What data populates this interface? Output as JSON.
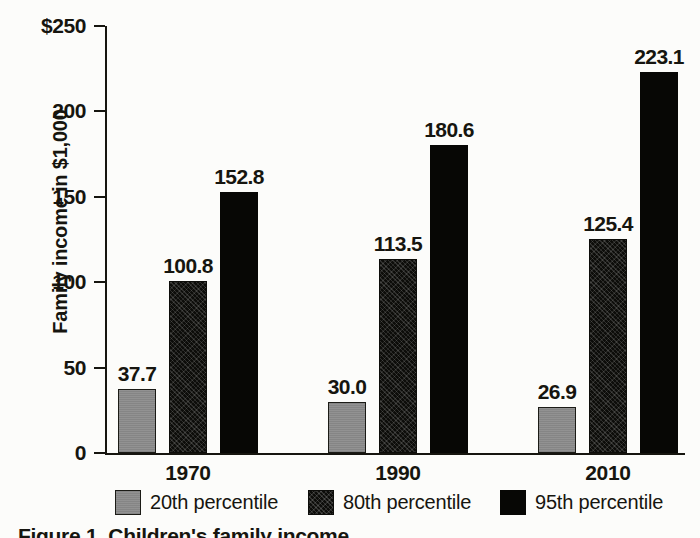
{
  "chart_data": {
    "type": "bar",
    "title": "",
    "xlabel": "",
    "ylabel": "Family income in $1,000",
    "categories": [
      "1970",
      "1990",
      "2010"
    ],
    "series": [
      {
        "name": "20th percentile",
        "values": [
          37.7,
          30.0,
          26.9
        ],
        "color": "#8c8c8c"
      },
      {
        "name": "80th percentile",
        "values": [
          100.8,
          113.5,
          125.4
        ],
        "color": "#0d0d0a"
      },
      {
        "name": "95th percentile",
        "values": [
          152.8,
          180.6,
          223.1
        ],
        "color": "#070705"
      }
    ],
    "value_labels": [
      [
        "37.7",
        "100.8",
        "152.8"
      ],
      [
        "30.0",
        "113.5",
        "180.6"
      ],
      [
        "26.9",
        "125.4",
        "223.1"
      ]
    ],
    "ylim": [
      0,
      250
    ],
    "ytick_values": [
      0,
      50,
      100,
      150,
      200,
      250
    ],
    "ytick_labels": [
      "0",
      "50",
      "100",
      "150",
      "200",
      "$250"
    ],
    "grid": false,
    "legend_position": "bottom"
  },
  "axis": {
    "y_title": "Family income in $1,000",
    "ticks": [
      {
        "label": "$250",
        "value": 250
      },
      {
        "label": "200",
        "value": 200
      },
      {
        "label": "150",
        "value": 150
      },
      {
        "label": "100",
        "value": 100
      },
      {
        "label": "50",
        "value": 50
      },
      {
        "label": "0",
        "value": 0
      }
    ]
  },
  "groups": [
    {
      "year": "1970",
      "bars": [
        {
          "series": "20th percentile",
          "label": "37.7",
          "value": 37.7
        },
        {
          "series": "80th percentile",
          "label": "100.8",
          "value": 100.8
        },
        {
          "series": "95th percentile",
          "label": "152.8",
          "value": 152.8
        }
      ]
    },
    {
      "year": "1990",
      "bars": [
        {
          "series": "20th percentile",
          "label": "30.0",
          "value": 30.0
        },
        {
          "series": "80th percentile",
          "label": "113.5",
          "value": 113.5
        },
        {
          "series": "95th percentile",
          "label": "180.6",
          "value": 180.6
        }
      ]
    },
    {
      "year": "2010",
      "bars": [
        {
          "series": "20th percentile",
          "label": "26.9",
          "value": 26.9
        },
        {
          "series": "80th percentile",
          "label": "125.4",
          "value": 125.4
        },
        {
          "series": "95th percentile",
          "label": "223.1",
          "value": 223.1
        }
      ]
    }
  ],
  "legend": {
    "items": [
      {
        "label": "20th percentile",
        "swatch": "p20"
      },
      {
        "label": "80th percentile",
        "swatch": "p80"
      },
      {
        "label": "95th percentile",
        "swatch": "p95"
      }
    ]
  },
  "caption": {
    "text": "Figure 1.  Children's family income"
  }
}
